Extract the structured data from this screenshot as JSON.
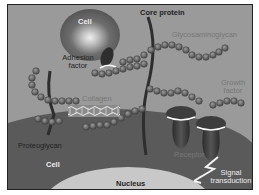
{
  "diagram": {
    "labels": {
      "cell_top": "Cell",
      "adhesion_factor": "Adhesion factor",
      "core_protein": "Core protein",
      "glycosaminoglycan": "Glycosaminoglycan",
      "collagen": "Collagen",
      "growth_factor": "Growth factor",
      "proteoglycan": "Proteoglycan",
      "cell_bottom": "Cell",
      "receptor": "Receptor",
      "signal_transduction": "Signal transduction",
      "nucleus": "Nucleus"
    },
    "colors": {
      "background": "#9a9a9a",
      "cell_body": "#5a5a5a",
      "nucleus": "#c8c8c8",
      "bead_chain": "#6b6b6b",
      "core_protein": "#2e2e2e",
      "receptor": "#3d3d3d"
    }
  }
}
